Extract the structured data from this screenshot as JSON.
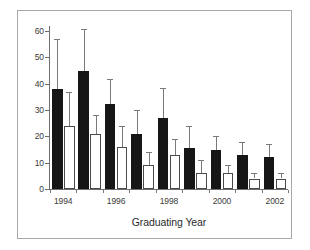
{
  "chart_data": {
    "type": "bar",
    "title": "",
    "subtitle": "",
    "xlabel": "Graduating Year",
    "ylabel": "",
    "ylim": [
      0,
      65
    ],
    "yticks": [
      0,
      10,
      20,
      30,
      40,
      50,
      60
    ],
    "ytick_labels": [
      "0",
      "10",
      "20",
      "30",
      "40",
      "50",
      "60"
    ],
    "grid": false,
    "legend": null,
    "orientation": "vertical",
    "error_bars": "upper-only",
    "categories": [
      "1994",
      "1995",
      "1996",
      "1997",
      "1998",
      "1999",
      "2000",
      "2001",
      "2002"
    ],
    "xtick_labels_shown": [
      "1994",
      "1996",
      "1998",
      "2000",
      "2002"
    ],
    "xtick_label_positions": [
      0,
      2,
      4,
      6,
      8
    ],
    "series": [
      {
        "name": "black",
        "fill": "#161616",
        "values": [
          38,
          45,
          32.5,
          21,
          27,
          15.5,
          15,
          13,
          12
        ],
        "error_upper": [
          57,
          61,
          42,
          30,
          38.5,
          24,
          20,
          18,
          17
        ]
      },
      {
        "name": "white",
        "fill": "#ffffff",
        "values": [
          24,
          21,
          16,
          9,
          13,
          6,
          6,
          4,
          4
        ],
        "error_upper": [
          37,
          28,
          24,
          14,
          19,
          11,
          9,
          6,
          6
        ]
      }
    ]
  },
  "colors": {
    "black_bar": "#161616",
    "white_bar": "#ffffff",
    "bar_outline": "#4a4a4a",
    "axis": "#6e6e6e",
    "error_bar": "#7a7a7a",
    "frame": "#a8a8a8",
    "text": "#3a3a3a"
  }
}
